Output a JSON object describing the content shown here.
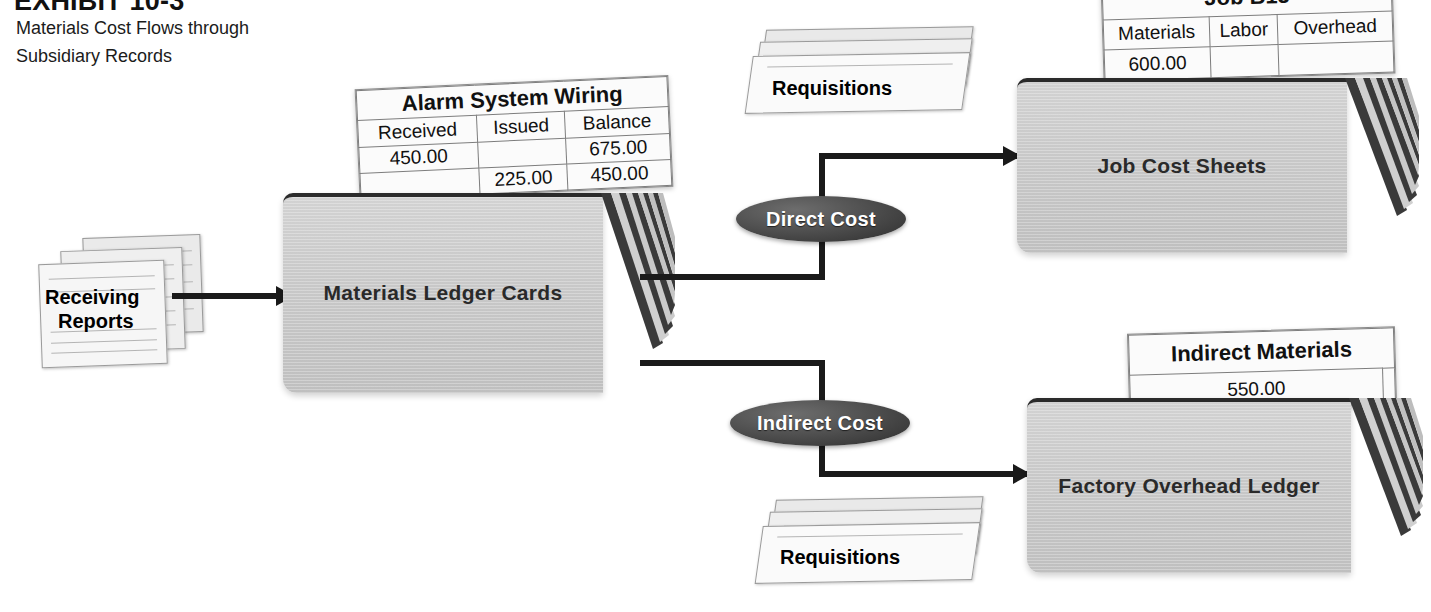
{
  "header": {
    "exhibit_label": "EXHIBIT 10-3",
    "caption_line1": "Materials Cost Flows through",
    "caption_line2": "Subsidiary Records"
  },
  "nodes": {
    "receiving_reports": {
      "label_line1": "Receiving",
      "label_line2": "Reports"
    },
    "materials_ledger_cards": {
      "label": "Materials Ledger Cards"
    },
    "requisitions_top": {
      "label": "Requisitions"
    },
    "requisitions_bottom": {
      "label": "Requisitions"
    },
    "job_cost_sheets": {
      "label": "Job Cost Sheets"
    },
    "factory_overhead_ledger": {
      "label": "Factory Overhead Ledger"
    }
  },
  "connectors": {
    "direct_cost": {
      "label": "Direct Cost"
    },
    "indirect_cost": {
      "label": "Indirect Cost"
    }
  },
  "cards": {
    "alarm_system_wiring": {
      "title": "Alarm System Wiring",
      "columns": [
        "Received",
        "Issued",
        "Balance"
      ],
      "rows": [
        [
          "450.00",
          "",
          "675.00"
        ],
        [
          "",
          "225.00",
          "450.00"
        ]
      ]
    },
    "job_b15": {
      "title": "Job B15",
      "columns": [
        "Materials",
        "Labor",
        "Overhead"
      ],
      "rows": [
        [
          "600.00",
          "",
          ""
        ]
      ]
    },
    "indirect_materials": {
      "title": "Indirect Materials",
      "columns": [
        "",
        ""
      ],
      "rows": [
        [
          "550.00",
          ""
        ]
      ]
    }
  },
  "colors": {
    "card_face": "#c8c8c8",
    "connector": "#1a1a1a",
    "pill_fill": "#3d3d3d",
    "pill_text": "#ffffff",
    "text": "#2a2a2a"
  }
}
